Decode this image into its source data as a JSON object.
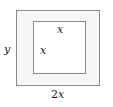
{
  "figure": {
    "type": "geometry-diagram",
    "outer_rectangle": {
      "name": "outer-rectangle",
      "width_label": "2x",
      "width_label_coefficient": "2",
      "width_label_variable": "x",
      "height_label": "y",
      "fill_color": "#f6f6f6",
      "stroke_color": "#8a8a8a"
    },
    "inner_square": {
      "name": "inner-square",
      "top_side_label": "x",
      "left_side_label": "x",
      "fill_color": "#ffffff",
      "stroke_color": "#8a8a8a"
    },
    "labels": {
      "height": "y",
      "base": "2x",
      "base_coefficient": "2",
      "base_variable": "x",
      "square_top": "x",
      "square_left": "x"
    },
    "colors": {
      "text": "#1c1c1c",
      "stroke": "#8a8a8a",
      "outer_fill": "#f6f6f6",
      "inner_fill": "#ffffff",
      "background": "#ffffff"
    }
  }
}
